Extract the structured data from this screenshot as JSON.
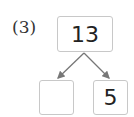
{
  "problem_label": "(3)",
  "number_bond": {
    "whole": "13",
    "parts": [
      "",
      "5"
    ]
  },
  "colors": {
    "arrow": "#777777",
    "box_border": "#c8c8c8"
  }
}
